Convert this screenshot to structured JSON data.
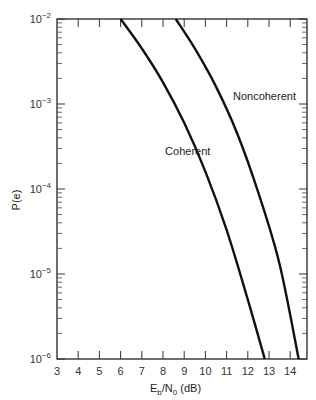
{
  "chart_data": {
    "type": "line",
    "title": "",
    "xlabel": "Eb/N0 (dB)",
    "xlabel_main": "E",
    "xlabel_sub1": "b",
    "xlabel_mid": "/N",
    "xlabel_sub2": "0",
    "xlabel_tail": " (dB)",
    "ylabel": "P(e)",
    "xlim": [
      3,
      15
    ],
    "ylim": [
      1e-06,
      0.01
    ],
    "yscale": "log",
    "xticks": [
      3,
      4,
      5,
      6,
      7,
      8,
      9,
      10,
      11,
      12,
      13,
      14
    ],
    "yticks": [
      {
        "value": 0.01,
        "base": "10",
        "exp": "−2"
      },
      {
        "value": 0.001,
        "base": "10",
        "exp": "−3"
      },
      {
        "value": 0.0001,
        "base": "10",
        "exp": "−4"
      },
      {
        "value": 1e-05,
        "base": "10",
        "exp": "−5"
      },
      {
        "value": 1e-06,
        "base": "10",
        "exp": "−6"
      }
    ],
    "grid": false,
    "series": [
      {
        "name": "Coherent",
        "x": [
          6.0,
          7.0,
          8.0,
          9.0,
          10.0,
          11.0,
          12.0,
          12.8
        ],
        "y": [
          0.01,
          0.0045,
          0.0018,
          0.0006,
          0.00016,
          3.3e-05,
          5e-06,
          1e-06
        ],
        "label_pos": {
          "x": 8.1,
          "y": 0.00025
        }
      },
      {
        "name": "Noncoherent",
        "x": [
          8.6,
          9.5,
          10.5,
          11.5,
          12.5,
          13.5,
          14.4
        ],
        "y": [
          0.01,
          0.0045,
          0.0016,
          0.00045,
          9e-05,
          1.3e-05,
          1e-06
        ],
        "label_pos": {
          "x": 11.3,
          "y": 0.0011
        }
      }
    ]
  }
}
